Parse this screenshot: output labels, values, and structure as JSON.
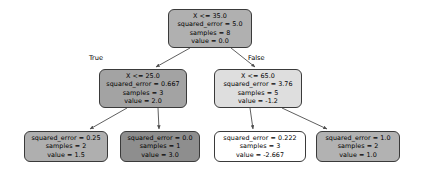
{
  "figure": {
    "type": "decision-tree",
    "background": "#ffffff",
    "node_border_color": "#3a3a3a",
    "edge_color": "#4d4d4d"
  },
  "edge_labels": {
    "true_label": "True",
    "false_label": "False"
  },
  "nodes": [
    {
      "id": "root",
      "condition": "X <= 35.0",
      "error": "squared_error = 5.0",
      "samples": "samples = 8",
      "value": "value = 0.0",
      "fill": "#b0b0b0",
      "x": 168,
      "y": 9,
      "w": 84,
      "h": 39
    },
    {
      "id": "left",
      "condition": "X <= 25.0",
      "error": "squared_error = 0.667",
      "samples": "samples = 3",
      "value": "value = 2.0",
      "fill": "#a3a3a3",
      "x": 99,
      "y": 69,
      "w": 88,
      "h": 39
    },
    {
      "id": "right",
      "condition": "X <= 65.0",
      "error": "squared_error = 3.76",
      "samples": "samples = 5",
      "value": "value = -1.2",
      "fill": "#dedede",
      "x": 214,
      "y": 69,
      "w": 88,
      "h": 39
    },
    {
      "id": "leaf1",
      "condition": "",
      "error": "squared_error = 0.25",
      "samples": "samples = 2",
      "value": "value = 1.5",
      "fill": "#afafaf",
      "x": 24,
      "y": 131,
      "w": 84,
      "h": 31
    },
    {
      "id": "leaf2",
      "condition": "",
      "error": "squared_error = 0.0",
      "samples": "samples = 1",
      "value": "value = 3.0",
      "fill": "#8e8e8e",
      "x": 120,
      "y": 131,
      "w": 80,
      "h": 31
    },
    {
      "id": "leaf3",
      "condition": "",
      "error": "squared_error = 0.222",
      "samples": "samples = 3",
      "value": "value = -2.667",
      "fill": "#ffffff",
      "x": 214,
      "y": 131,
      "w": 92,
      "h": 31
    },
    {
      "id": "leaf4",
      "condition": "",
      "error": "squared_error = 1.0",
      "samples": "samples = 2",
      "value": "value = 1.0",
      "fill": "#b2b2b2",
      "x": 316,
      "y": 131,
      "w": 84,
      "h": 31
    }
  ]
}
